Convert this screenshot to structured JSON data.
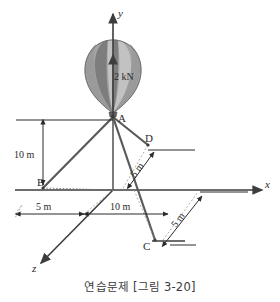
{
  "figure": {
    "caption": "연습문제 [그림 3-20]",
    "axes": {
      "y_label": "y",
      "x_label": "x",
      "z_label": "z"
    },
    "points": {
      "a": "A",
      "b": "B",
      "c": "C",
      "d": "D"
    },
    "force": {
      "label": "2 kN"
    },
    "dimensions": {
      "height_ab": "10 m",
      "offset_b_x": "5 m",
      "span_x": "10 m",
      "depth_d": "5 m",
      "depth_c": "5 m"
    },
    "colors": {
      "cable": "#5a5a5a",
      "axis": "#3d3d3d",
      "dimension": "#2b2b2b",
      "balloon_light": "#b9b9b9",
      "balloon_dark": "#7d7d7d",
      "text": "#2b2b2b",
      "background": "#ffffff"
    }
  }
}
